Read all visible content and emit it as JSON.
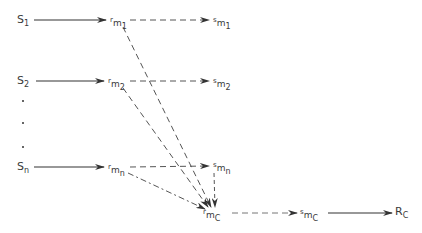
{
  "diagram": {
    "stimuli": [
      {
        "id": "s1",
        "base": "S",
        "sub": "1",
        "x": 17,
        "y": 14
      },
      {
        "id": "s2",
        "base": "S",
        "sub": "2",
        "x": 17,
        "y": 75
      },
      {
        "id": "sn",
        "base": "S",
        "sub": "n",
        "x": 17,
        "y": 161
      }
    ],
    "responses": [
      {
        "id": "rm1",
        "base": "r",
        "mid": "m",
        "sub": "1",
        "x": 110,
        "y": 14
      },
      {
        "id": "rm2",
        "base": "r",
        "mid": "m",
        "sub": "2",
        "x": 108,
        "y": 75
      },
      {
        "id": "rmn",
        "base": "r",
        "mid": "m",
        "sub": "n",
        "x": 108,
        "y": 161
      },
      {
        "id": "rmc",
        "base": "r",
        "mid": "m",
        "sub": "C",
        "x": 203,
        "y": 206
      }
    ],
    "mediators": [
      {
        "id": "sm1",
        "base": "s",
        "mid": "m",
        "sub": "1",
        "x": 213,
        "y": 14
      },
      {
        "id": "sm2",
        "base": "s",
        "mid": "m",
        "sub": "2",
        "x": 213,
        "y": 75
      },
      {
        "id": "smn",
        "base": "s",
        "mid": "m",
        "sub": "n",
        "x": 213,
        "y": 159
      },
      {
        "id": "smc",
        "base": "s",
        "mid": "m",
        "sub": "C",
        "x": 300,
        "y": 206
      }
    ],
    "final": {
      "id": "rc",
      "base": "R",
      "sub": "C",
      "x": 395,
      "y": 206
    },
    "ellipsis_dots": [
      {
        "x": 22,
        "y": 105
      },
      {
        "x": 22,
        "y": 122
      },
      {
        "x": 22,
        "y": 146
      }
    ],
    "colors": {
      "line": "#333333",
      "dashed": "#555555"
    }
  }
}
